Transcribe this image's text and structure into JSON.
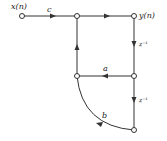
{
  "diagram": {
    "type": "signal-flow-graph",
    "input_label": "x(n)",
    "output_label": "y(n)",
    "branches": {
      "input_gain": "c",
      "feedback_a": "a",
      "feedback_b": "b",
      "delay_1": "z⁻¹",
      "delay_2": "z⁻¹"
    },
    "colors": {
      "line": "#333333",
      "node_fill": "#ffffff"
    }
  }
}
